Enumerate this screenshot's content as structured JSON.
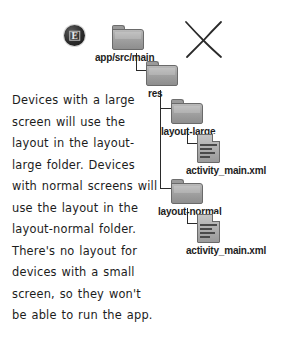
{
  "note": {
    "text": "Devices with a large screen will use the layout in the layout-large folder. Devices with normal screens will use the layout in the layout-normal folder. There's no layout for devices with a small screen, so they won't be able to run the app."
  },
  "badge": {
    "glyph": "E",
    "color": "#2b2b2b"
  },
  "xmark": {
    "label": "hand-drawn-x",
    "color": "#2a2a2a"
  },
  "tree": {
    "nodes": [
      {
        "id": "app-src-main",
        "label": "app/src/main",
        "type": "folder"
      },
      {
        "id": "res",
        "label": "res",
        "type": "folder"
      },
      {
        "id": "layout-large",
        "label": "layout-large",
        "type": "folder"
      },
      {
        "id": "layout-large-file",
        "label": "activity_main.xml",
        "type": "xml-file"
      },
      {
        "id": "layout-normal",
        "label": "layout-normal",
        "type": "folder"
      },
      {
        "id": "layout-normal-file",
        "label": "activity_main.xml",
        "type": "xml-file"
      }
    ]
  },
  "colors": {
    "folder_face": "#a2a2a2",
    "folder_edge": "#6a6a6a",
    "file_face": "#ababab",
    "ink": "#1c1c1c",
    "background": "#ffffff"
  }
}
